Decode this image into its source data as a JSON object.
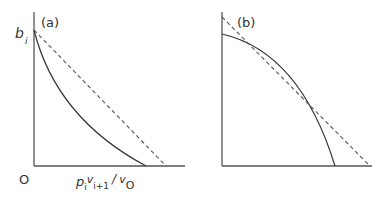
{
  "figure": {
    "panels": [
      {
        "id": "a",
        "label": "(a)",
        "y_axis_label_main": "b",
        "y_axis_label_sub": "i",
        "origin_label": "O",
        "x_axis_label": {
          "p": "p",
          "p_sub": "i",
          "v1": "v",
          "v1_sub": "i+1",
          "slash": "/",
          "v2": "v",
          "v2_sub": "O"
        },
        "curves": [
          {
            "name": "solid-convex-curve",
            "style": "solid",
            "description": "convex curve from b_i on y-axis down to x-axis, lying below dashed line"
          },
          {
            "name": "dashed-straight-line",
            "style": "dashed",
            "description": "straight line from b_i to x-axis intercept"
          }
        ]
      },
      {
        "id": "b",
        "label": "(b)",
        "curves": [
          {
            "name": "solid-concave-curve",
            "style": "solid",
            "description": "concave curve from y-axis down to x-axis, tangent to dashed line"
          },
          {
            "name": "dashed-tangent-line",
            "style": "dashed",
            "description": "straight tangent line touching the concave curve"
          }
        ]
      }
    ],
    "colors": {
      "line": "#333333",
      "dashed": "#555555",
      "axis": "#555555"
    }
  }
}
